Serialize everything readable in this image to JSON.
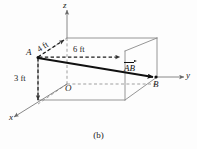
{
  "figure": {
    "caption": "(b)",
    "axes": [
      {
        "id": "z",
        "label": "z"
      },
      {
        "id": "y",
        "label": "y"
      },
      {
        "id": "x",
        "label": "x"
      }
    ],
    "origin_label": "O",
    "points": [
      {
        "id": "A",
        "label": "A"
      },
      {
        "id": "B",
        "label": "B"
      }
    ],
    "dimensions": [
      {
        "id": "depth",
        "label": "4 ft"
      },
      {
        "id": "length",
        "label": "6 ft"
      },
      {
        "id": "height",
        "label": "3 ft"
      }
    ],
    "vector": {
      "label": "AB",
      "name": "vector-AB"
    },
    "colors": {
      "box_edge": "#8a8a8a",
      "dashed": "#6e6e6e",
      "vector": "#101010",
      "text": "#1a1a1a",
      "background": "#fdfdfd"
    }
  }
}
